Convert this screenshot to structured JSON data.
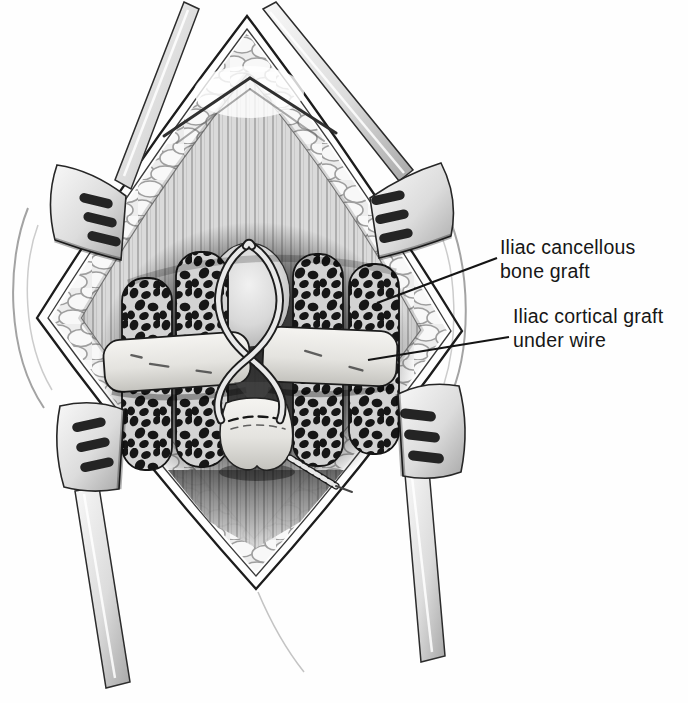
{
  "figure": {
    "background": "#fefefe",
    "ink": "#161616",
    "annotations": {
      "cancellous": {
        "line1": "Iliac cancellous",
        "line2": "bone graft"
      },
      "cortical": {
        "line1": "Iliac cortical graft",
        "line2": "under wire"
      }
    }
  }
}
